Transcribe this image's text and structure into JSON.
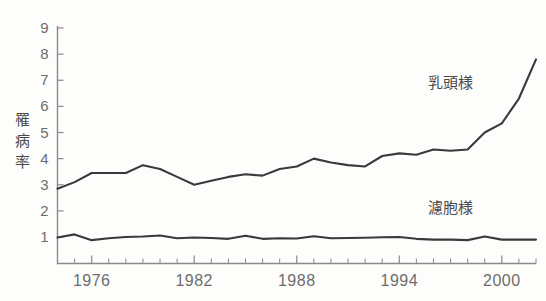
{
  "chart_data": {
    "type": "line",
    "title": "",
    "xlabel": "",
    "ylabel": "罹病率",
    "ylabel_chars": [
      "罹",
      "病",
      "率"
    ],
    "xlim": [
      1974,
      2002
    ],
    "ylim": [
      0,
      9
    ],
    "yticks": [
      1,
      2,
      3,
      4,
      5,
      6,
      7,
      8,
      9
    ],
    "ytick_labels": [
      "1",
      "2",
      "3",
      "4",
      "5",
      "6",
      "7",
      "8",
      "9"
    ],
    "xticks": [
      1976,
      1982,
      1988,
      1994,
      2000
    ],
    "xtick_labels": [
      "1976",
      "1982",
      "1988",
      "1994",
      "2000"
    ],
    "x_minor_tick_interval": 1,
    "grid": false,
    "legend": "inline-annotations",
    "line_color": "#3a3a3a",
    "axis_color": "#8a8a8a",
    "background_color": "#fdfdfb",
    "x": [
      1974,
      1975,
      1976,
      1977,
      1978,
      1979,
      1980,
      1981,
      1982,
      1983,
      1984,
      1985,
      1986,
      1987,
      1988,
      1989,
      1990,
      1991,
      1992,
      1993,
      1994,
      1995,
      1996,
      1997,
      1998,
      1999,
      2000,
      2001,
      2002
    ],
    "series": [
      {
        "name": "乳頭様",
        "label": "乳頭様",
        "values": [
          2.85,
          3.1,
          3.45,
          3.45,
          3.45,
          3.75,
          3.6,
          3.3,
          3.0,
          3.15,
          3.3,
          3.4,
          3.35,
          3.6,
          3.7,
          4.0,
          3.85,
          3.75,
          3.7,
          4.1,
          4.2,
          4.15,
          4.35,
          4.3,
          4.35,
          5.0,
          5.35,
          6.3,
          7.8
        ],
        "annotation": {
          "text": "乳頭様",
          "x": 1997,
          "y": 6.7
        }
      },
      {
        "name": "濾胞様",
        "label": "濾胞様",
        "values": [
          0.98,
          1.1,
          0.88,
          0.95,
          1.0,
          1.02,
          1.06,
          0.95,
          0.98,
          0.96,
          0.93,
          1.05,
          0.93,
          0.95,
          0.94,
          1.03,
          0.95,
          0.96,
          0.97,
          0.99,
          1.0,
          0.93,
          0.9,
          0.9,
          0.88,
          1.02,
          0.9,
          0.9,
          0.9
        ],
        "annotation": {
          "text": "濾胞様",
          "x": 1997,
          "y": 1.9
        }
      }
    ]
  },
  "axis_title": {
    "text": "罹病率",
    "orientation": "vertical"
  }
}
